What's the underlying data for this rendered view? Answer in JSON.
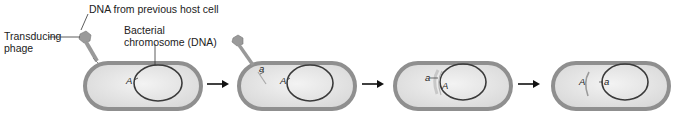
{
  "figure": {
    "labels": {
      "transducing_phage_line1": "Transducing",
      "transducing_phage_line2": "phage",
      "dna_from_host": "DNA from previous host cell",
      "bacterial_chromosome_line1": "Bacterial",
      "bacterial_chromosome_line2": "chromosome (DNA)"
    },
    "panels": [
      {
        "id": 1,
        "genes": [
          {
            "label": "A"
          }
        ]
      },
      {
        "id": 2,
        "genes": [
          {
            "label": "a"
          },
          {
            "label": "A"
          }
        ]
      },
      {
        "id": 3,
        "genes": [
          {
            "label": "a"
          },
          {
            "label": "A"
          }
        ]
      },
      {
        "id": 4,
        "genes": [
          {
            "label": "A"
          },
          {
            "label": "a"
          }
        ]
      }
    ],
    "arrow_count": 3,
    "colors": {
      "cell_wall": "#8f8f8f",
      "cytoplasm": "#e6e6e6",
      "chromosome": "#3a3a3a",
      "phage": "#9a9a9a",
      "arrow": "#111111"
    }
  }
}
